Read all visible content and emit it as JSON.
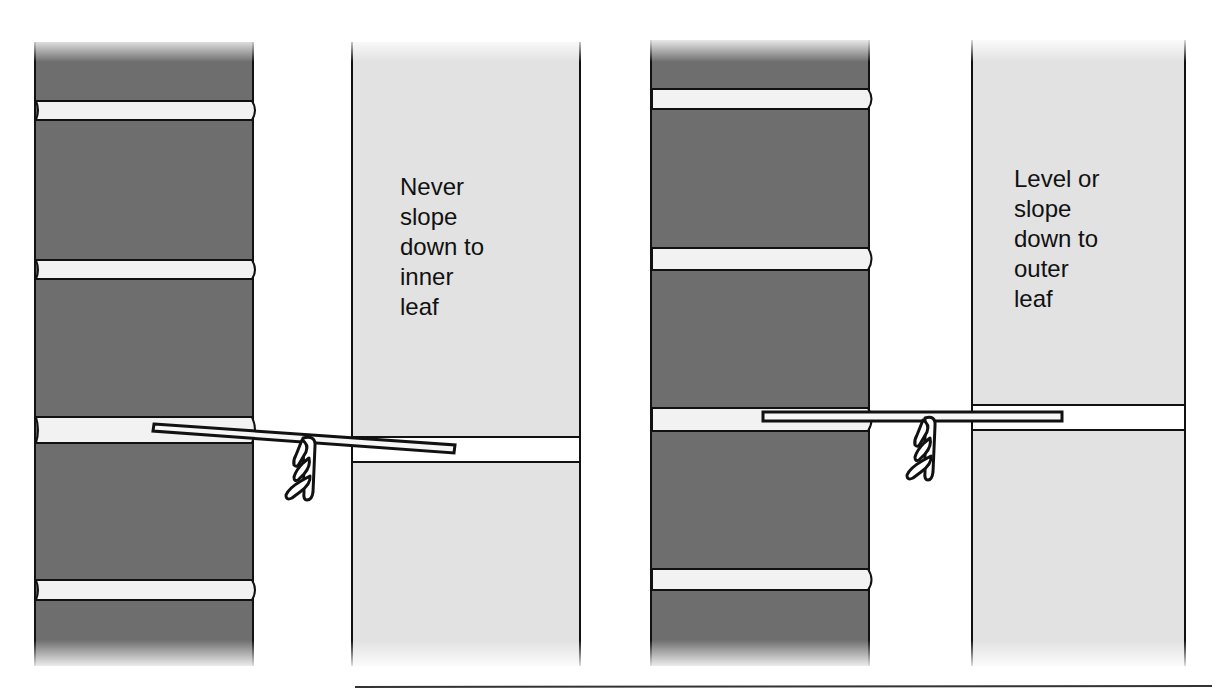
{
  "colors": {
    "outer_leaf": "#6e6e6e",
    "inner_leaf": "#e2e2e2",
    "mortar": "#f2f2f2",
    "outline": "#111111",
    "background": "#ffffff"
  },
  "panels": [
    {
      "id": "incorrect",
      "label_lines": [
        "Never",
        "slope",
        "down to",
        "inner",
        "leaf"
      ],
      "label_text": "Never\nslope\ndown to\ninner\nleaf",
      "tie_orientation": "slopes down to inner leaf",
      "outer_leaf": {
        "x": 35,
        "width": 218,
        "joints_y": [
          101,
          260,
          418,
          580
        ]
      },
      "inner_leaf": {
        "x": 352,
        "width": 228,
        "joint_y": 437
      },
      "tie": {
        "x1": 155,
        "y1": 427,
        "x2": 453,
        "y2": 449
      }
    },
    {
      "id": "correct",
      "label_lines": [
        "Level or",
        "slope",
        "down to",
        "outer",
        "leaf"
      ],
      "label_text": "Level or\nslope\ndown to\nouter\nleaf",
      "tie_orientation": "level",
      "outer_leaf": {
        "x": 651,
        "width": 218,
        "joints_y": [
          89,
          249,
          409,
          569
        ]
      },
      "inner_leaf": {
        "x": 972,
        "width": 213,
        "joint_y": 406
      },
      "tie": {
        "x1": 763,
        "y1": 416,
        "x2": 1062,
        "y2": 416
      }
    }
  ]
}
